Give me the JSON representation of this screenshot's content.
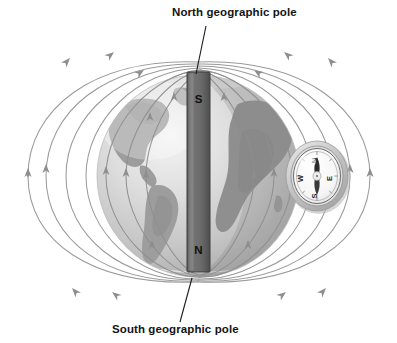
{
  "figure": {
    "background_color": "#ffffff",
    "width": 397,
    "height": 343
  },
  "labels": {
    "north_pole": "North geographic pole",
    "south_pole": "South geographic pole"
  },
  "magnet": {
    "top_pole_label": "S",
    "bottom_pole_label": "N",
    "body_color": "#6e6e6e",
    "edge_color": "#3c3c3c"
  },
  "globe": {
    "ocean_color": "#d8d8d8",
    "land_color": "#9a9a9a",
    "highlight_color": "#f2f2f2",
    "shadow_color": "#8f8f8f"
  },
  "field_lines": {
    "color": "#9a9a9a",
    "arrow_color": "#8e8e8e",
    "direction": "northward",
    "count": 14
  },
  "compass": {
    "north": "N",
    "east": "E",
    "south": "S",
    "west": "W",
    "case_color": "#cfcfcf",
    "dial_color": "#fbfbfb",
    "needle_color": "#2a2a2a"
  },
  "leader_lines": {
    "color": "#1a1a1a"
  }
}
